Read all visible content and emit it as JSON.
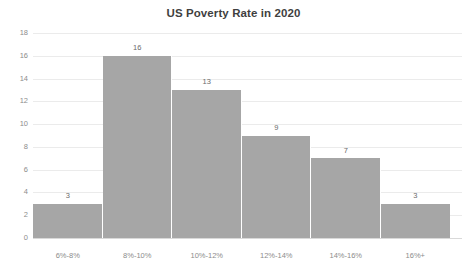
{
  "chart_data": {
    "type": "bar",
    "title": "US Poverty Rate in 2020",
    "subtitle": "",
    "xlabel": "",
    "ylabel": "",
    "categories": [
      "6%-8%",
      "8%-10%",
      "10%-12%",
      "12%-14%",
      "14%-16%",
      "16%+"
    ],
    "values": [
      3,
      16,
      13,
      9,
      7,
      3
    ],
    "value_labels": [
      "3",
      "16",
      "13",
      "9",
      "7",
      "3"
    ],
    "ylim": [
      0,
      18
    ],
    "ytick_labels": [
      "18",
      "16",
      "14",
      "12",
      "10",
      "8",
      "6",
      "4",
      "2",
      "0"
    ],
    "ytick_values": [
      18,
      16,
      14,
      12,
      10,
      8,
      6,
      4,
      2,
      0
    ],
    "grid": true,
    "legend": false,
    "legend_position": "none",
    "series": [
      {
        "name": "Number of states",
        "values": [
          3,
          16,
          13,
          9,
          7,
          3
        ]
      }
    ],
    "colors": {
      "bar_fill": "#a6a6a6",
      "gridline": "#ebebeb",
      "baseline": "#d9d9d9",
      "title_text": "#3f3f3f",
      "axis_text": "#8c8c8c",
      "value_text": "#6b6b6b",
      "background": "#ffffff"
    }
  }
}
